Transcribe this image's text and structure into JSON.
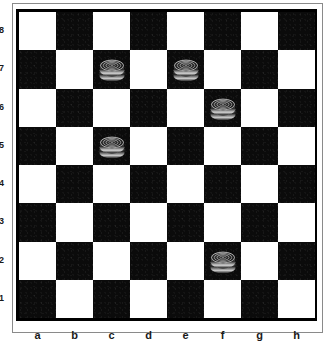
{
  "board": {
    "size": 8,
    "files": [
      "a",
      "b",
      "c",
      "d",
      "e",
      "f",
      "g",
      "h"
    ],
    "ranks": [
      "8",
      "7",
      "6",
      "5",
      "4",
      "3",
      "2",
      "1"
    ],
    "light_square_color": "#ffffff",
    "dark_square_color": "#0b0b0b",
    "orientation": "white-bottom",
    "top_left_square_color": "light",
    "border_color": "#000000",
    "frame_color": "#8a8a8a"
  },
  "pieces": [
    {
      "square": "c7",
      "file": "c",
      "rank": "7",
      "color": "black",
      "type": "king",
      "stacked": true,
      "label": "black-king-c7"
    },
    {
      "square": "e7",
      "file": "e",
      "rank": "7",
      "color": "black",
      "type": "king",
      "stacked": true,
      "label": "black-king-e7"
    },
    {
      "square": "f6",
      "file": "f",
      "rank": "6",
      "color": "black",
      "type": "king",
      "stacked": true,
      "label": "black-king-f6"
    },
    {
      "square": "c5",
      "file": "c",
      "rank": "5",
      "color": "black",
      "type": "king",
      "stacked": true,
      "label": "black-king-c5"
    },
    {
      "square": "f2",
      "file": "f",
      "rank": "2",
      "color": "black",
      "type": "king",
      "stacked": true,
      "label": "black-king-f2"
    }
  ],
  "piece_colors": {
    "body_dark": "#101010",
    "body_mid": "#2b2b2b",
    "ring_light": "#d8d8d8",
    "ring_mid": "#9a9a9a",
    "edge_highlight": "#e8e8e8"
  },
  "counts": {
    "black_pieces": "5",
    "white_pieces": "0"
  }
}
